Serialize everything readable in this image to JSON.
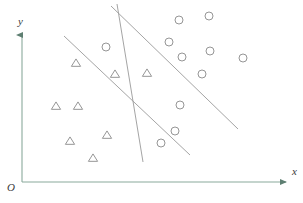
{
  "figure": {
    "title": "",
    "width": 303,
    "height": 203,
    "background": "#ffffff"
  },
  "axes": {
    "x_label": "x",
    "y_label": "y",
    "origin_label": "O",
    "color": "#7e9a8e",
    "x_axis": {
      "x1": 22,
      "y1": 182,
      "x2": 288,
      "y2": 182
    },
    "y_axis": {
      "x1": 22,
      "y1": 182,
      "x2": 22,
      "y2": 33
    },
    "arrow_style": "filled-triangle"
  },
  "chart_data": {
    "type": "scatter",
    "title": "",
    "xlabel": "x",
    "ylabel": "y",
    "grid": false,
    "legend": null,
    "annotations": [],
    "marker_color": "#8a8a8a",
    "line_color": "#9a9a9a",
    "series": [
      {
        "name": "triangles",
        "marker": "triangle",
        "color": "#8a8a8a",
        "points": [
          [
            76,
            63
          ],
          [
            115,
            74
          ],
          [
            147,
            73
          ],
          [
            56,
            106
          ],
          [
            78,
            106
          ],
          [
            70,
            141
          ],
          [
            107,
            135
          ],
          [
            93,
            158
          ]
        ]
      },
      {
        "name": "circles",
        "marker": "circle",
        "color": "#8a8a8a",
        "points": [
          [
            106,
            47
          ],
          [
            179,
            20
          ],
          [
            209,
            16
          ],
          [
            169,
            42
          ],
          [
            182,
            57
          ],
          [
            210,
            51
          ],
          [
            243,
            58
          ],
          [
            202,
            74
          ],
          [
            180,
            105
          ],
          [
            175,
            131
          ],
          [
            161,
            143
          ]
        ]
      }
    ],
    "separating_lines": [
      {
        "name": "upper-diagonal",
        "x1": 111,
        "y1": 6,
        "x2": 238,
        "y2": 129
      },
      {
        "name": "steep-line",
        "x1": 117,
        "y1": 4,
        "x2": 143,
        "y2": 162
      },
      {
        "name": "lower-diagonal",
        "x1": 64,
        "y1": 36,
        "x2": 190,
        "y2": 155
      }
    ]
  }
}
